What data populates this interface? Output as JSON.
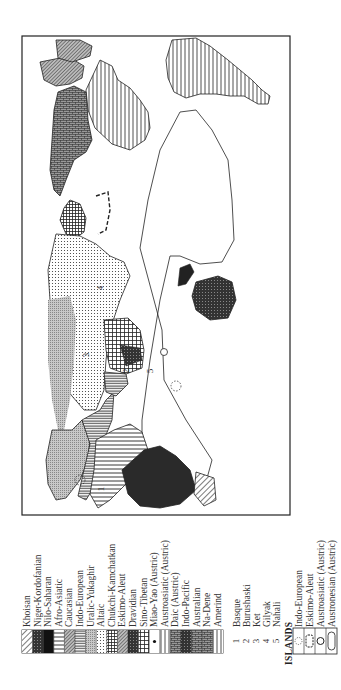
{
  "figure": {
    "orientation": "rotated 90 degrees counter-clockwise",
    "map_labels": [
      "1",
      "2",
      "3",
      "4",
      "5"
    ]
  },
  "legend": {
    "families": [
      {
        "label": "Khoisan",
        "pattern": "diagonal-hatch"
      },
      {
        "label": "Niger-Kordofanian",
        "pattern": "dark-horizontal"
      },
      {
        "label": "Nilo-Saharan",
        "pattern": "solid-black"
      },
      {
        "label": "Afro-Asiatic",
        "pattern": "horizontal-wide"
      },
      {
        "label": "Caucasian",
        "pattern": "crosshatch-diamond"
      },
      {
        "label": "Indo-European",
        "pattern": "horizontal-dense"
      },
      {
        "label": "Uralic-Yukaghir",
        "pattern": "stipple-gray"
      },
      {
        "label": "Altaic",
        "pattern": "dots"
      },
      {
        "label": "Chukchi-Kamchatkan",
        "pattern": "grid-dense"
      },
      {
        "label": "Eskimo-Aleut",
        "pattern": "diagonal-dense"
      },
      {
        "label": "Dravidian",
        "pattern": "dark-crosshatch"
      },
      {
        "label": "Sino-Tibetan",
        "pattern": "grid-wide"
      },
      {
        "label": "Miao-Yao (Austric)",
        "pattern": "dot-center"
      },
      {
        "label": "Austroasiatic (Austric)",
        "pattern": "vertical-dense"
      },
      {
        "label": "Daic (Austric)",
        "pattern": "brick-dark"
      },
      {
        "label": "Indo-Pacific",
        "pattern": "black-grid"
      },
      {
        "label": "Australian",
        "pattern": "dark-brick"
      },
      {
        "label": "Na-Dene",
        "pattern": "brick"
      },
      {
        "label": "Amerind",
        "pattern": "vertical-wide"
      }
    ],
    "isolates": [
      {
        "number": "1",
        "label": "Basque"
      },
      {
        "number": "2",
        "label": "Burushaski"
      },
      {
        "number": "3",
        "label": "Ket"
      },
      {
        "number": "4",
        "label": "Gilyak"
      },
      {
        "number": "5",
        "label": "Nahali"
      }
    ],
    "islands_title": "ISLANDS",
    "islands": [
      {
        "label": "Indo-European",
        "symbol": "dotted-circle"
      },
      {
        "label": "Eskimo-Aleut",
        "symbol": "dashed-rounded"
      },
      {
        "label": "Austroasiatic (Austric)",
        "symbol": "circle"
      },
      {
        "label": "Austronesian (Austric)",
        "symbol": "rounded-rect"
      }
    ]
  }
}
